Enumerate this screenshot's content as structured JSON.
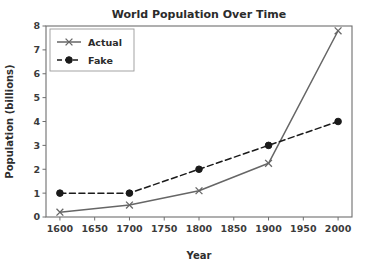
{
  "chart_data": {
    "type": "line",
    "title": "World Population Over Time",
    "xlabel": "Year",
    "ylabel": "Population (billions)",
    "x": [
      1600,
      1700,
      1800,
      1900,
      2000
    ],
    "xlim": [
      1580,
      2020
    ],
    "ylim": [
      0,
      8
    ],
    "xticks": [
      1600,
      1650,
      1700,
      1750,
      1800,
      1850,
      1900,
      1950,
      2000
    ],
    "xticklabels": [
      "1600",
      "1650",
      "1700",
      "1750",
      "1800",
      "1850",
      "1900",
      "1950",
      "2000"
    ],
    "yticks": [
      0,
      1,
      2,
      3,
      4,
      5,
      6,
      7,
      8
    ],
    "yticklabels": [
      "0",
      "1",
      "2",
      "3",
      "4",
      "5",
      "6",
      "7",
      "8"
    ],
    "grid": false,
    "legend_position": "upper left",
    "series": [
      {
        "name": "Actual",
        "values": [
          0.2,
          0.5,
          1.1,
          2.25,
          7.8
        ],
        "color": "#666666",
        "linestyle": "solid",
        "marker": "x"
      },
      {
        "name": "Fake",
        "values": [
          1.0,
          1.0,
          2.0,
          3.0,
          4.0
        ],
        "color": "#1a1a1a",
        "linestyle": "dashed",
        "marker": "circle"
      }
    ]
  },
  "legend": {
    "entries": [
      {
        "label": "Actual"
      },
      {
        "label": "Fake"
      }
    ]
  }
}
